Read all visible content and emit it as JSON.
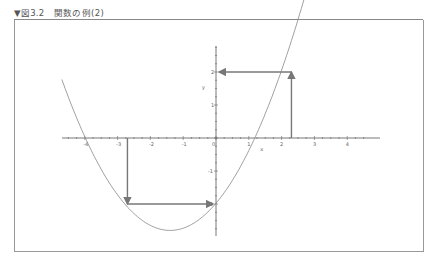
{
  "caption": "▼図3.2　関数の例(2)",
  "chart_data": {
    "type": "line",
    "title": "関数の例(2)",
    "xlabel": "x",
    "ylabel": "y",
    "xlim": [
      -4.5,
      4.5
    ],
    "ylim": [
      -2.9,
      2.9
    ],
    "x_ticks": [
      -4,
      -3,
      -2,
      -1,
      0,
      1,
      2,
      3,
      4
    ],
    "x_tick_labels": [
      "-4",
      "-3",
      "-2",
      "-1",
      "0",
      "1",
      "2",
      "3",
      "4"
    ],
    "y_tick_labels": [
      "2",
      "1",
      "-1",
      "-2"
    ],
    "series": [
      {
        "name": "parabola",
        "description": "upward parabola, vertex ≈ (-1.4, -2.8), roots ≈ -4.5 and 1.6",
        "points": [
          [
            -4.6,
            0.3
          ],
          [
            -4,
            -0.6
          ],
          [
            -3,
            -1.9
          ],
          [
            -2,
            -2.7
          ],
          [
            -1.4,
            -2.8
          ],
          [
            -1,
            -2.7
          ],
          [
            0,
            -2.1
          ],
          [
            1,
            -1.0
          ],
          [
            2,
            1.4
          ],
          [
            2.3,
            2.0
          ],
          [
            2.8,
            2.9
          ]
        ]
      }
    ],
    "annotations": [
      {
        "type": "arrow",
        "from": [
          2.3,
          0
        ],
        "to": [
          2.3,
          2
        ],
        "label": "vertical arrow to curve"
      },
      {
        "type": "arrow",
        "from": [
          2.3,
          2
        ],
        "to": [
          0,
          2
        ],
        "label": "horizontal arrow to y-axis"
      },
      {
        "type": "arrow",
        "from": [
          -2.7,
          0
        ],
        "to": [
          -2.7,
          -2
        ],
        "label": "vertical arrow to curve"
      },
      {
        "type": "arrow",
        "from": [
          -2.7,
          -2
        ],
        "to": [
          0,
          -2
        ],
        "label": "horizontal arrow to y-axis"
      }
    ],
    "grid": false,
    "legend": null
  },
  "axes": {
    "x_label": "x",
    "y_label": "y"
  }
}
